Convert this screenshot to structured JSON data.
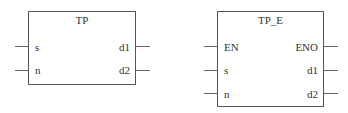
{
  "blocks": [
    {
      "name": "TP",
      "inputs": [
        "s",
        "n"
      ],
      "outputs": [
        "d1",
        "d2"
      ]
    },
    {
      "name": "TP_E",
      "inputs": [
        "EN",
        "s",
        "n"
      ],
      "outputs": [
        "ENO",
        "d1",
        "d2"
      ]
    }
  ]
}
